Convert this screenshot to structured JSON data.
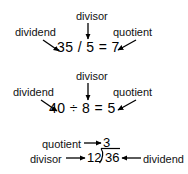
{
  "diagram": {
    "background_color": "#ffffff",
    "ink_color": "#000000",
    "blocks": [
      {
        "id": "block-slash",
        "expression": "35 / 5 = 7",
        "labels": {
          "dividend": "dividend",
          "divisor": "divisor",
          "quotient": "quotient"
        }
      },
      {
        "id": "block-obelus",
        "expression": "40 ÷ 8 = 5",
        "labels": {
          "dividend": "dividend",
          "divisor": "divisor",
          "quotient": "quotient"
        }
      },
      {
        "id": "block-long-division",
        "quotient_value": "3",
        "divisor_value": "12",
        "dividend_value": "36",
        "labels": {
          "quotient": "quotient",
          "divisor": "divisor",
          "dividend": "dividend"
        }
      }
    ]
  }
}
